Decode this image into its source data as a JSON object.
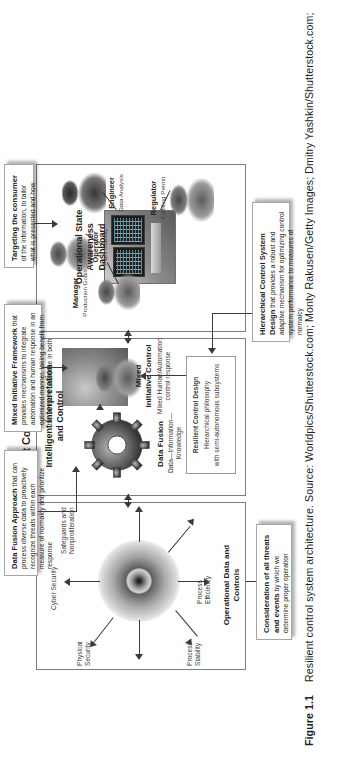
{
  "caption": {
    "number": "Figure 1.1",
    "text": "Resilient control system architecture. Source: Worldpics/Shutterstock.com; Monty Rakusen/Getty Images; Dmitry Yashkin/Shutterstock.com;"
  },
  "diagram": {
    "title": "Resilient Control System",
    "layers": {
      "top": {
        "name": "Operational State Awareness Dashboard",
        "stakeholders": [
          {
            "role": "Manager",
            "detail": "Production Goals"
          },
          {
            "role": "Operator",
            "detail": "Plant Stability"
          },
          {
            "role": "Engineer",
            "detail": "Data Analysis"
          },
          {
            "role": "Regulator",
            "detail": "Fulfilling Permit"
          }
        ]
      },
      "middle": {
        "title_line1": "Intelligent Interpretation",
        "title_line2": "and Control",
        "data_fusion_label": "Data Fusion",
        "data_fusion_sub": "Data—Information—\nKnowledge",
        "mixed_line1": "Mixed",
        "mixed_line2": "Initiative Control",
        "mixed_sub": "Mixed Human/Automation\ncontrol response",
        "inner_box_title": "Resilient Control Design",
        "inner_box_line1": "Hierarchical philosophy",
        "inner_box_line2": "with semi-autonomous subsystems"
      },
      "bottom": {
        "title_line1": "Operational Data and",
        "title_line2": "Controls",
        "spokes": [
          "Cyber Security",
          "Physical\nSecurity",
          "Process\nStability",
          "Process\nEfficiency",
          "Safeguards and\nNonproliferation"
        ]
      }
    },
    "callouts": [
      {
        "id": "data-fusion-approach",
        "bold": "Data Fusion Approach",
        "rest": " that can process diverse data to proactively recognize threats within each measure of normalcy and prioritize response"
      },
      {
        "id": "mixed-initiative-framework",
        "bold": "Mixed Initiative Framework",
        "rest": " that provides mechanisms to integrate automation and human response in an optimized manner, taking benefit from the inherent resilience in both"
      },
      {
        "id": "targeting-the-consumer",
        "bold": "Targeting the consumer",
        "rest": " of the information, to tailor what is presented and how"
      },
      {
        "id": "hierarchical-control-system-design",
        "bold": "Hierarchical Control System Design",
        "rest": " that provides a robust and adaptive mechanism for optimizing control system performance to measures of normalcy"
      },
      {
        "id": "consideration-of-all-threats",
        "bold": "Consideration of all threats and events",
        "rest": " by which we determine proper operation"
      }
    ]
  },
  "colors": {
    "ink": "#231f20",
    "rule": "#7d7d7d",
    "arrow": "#3a3a3a",
    "page": "#ffffff"
  }
}
